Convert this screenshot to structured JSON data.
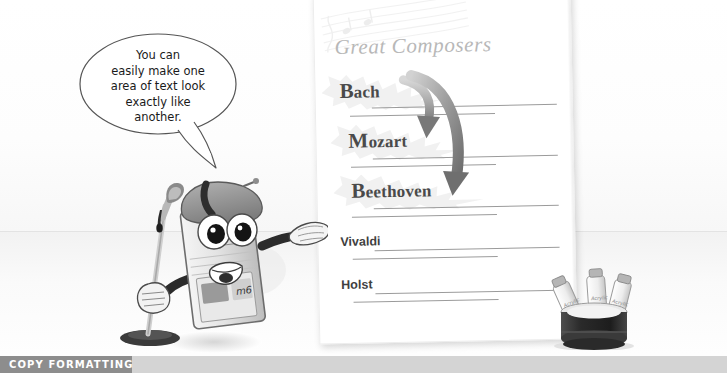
{
  "caption": {
    "label": "COPY FORMATTING"
  },
  "speech_bubble": {
    "lines": [
      "You can",
      "easily make one",
      "area of text look",
      "exactly like",
      "another."
    ],
    "text": "You can easily make one area of text look exactly like another."
  },
  "document": {
    "title": "Great Composers",
    "watermark": "music-staff-watermark",
    "entries": [
      {
        "name": "Bach",
        "style": "formatted",
        "initial": "B",
        "rest": "ach"
      },
      {
        "name": "Mozart",
        "style": "formatted",
        "initial": "M",
        "rest": "ozart"
      },
      {
        "name": "Beethoven",
        "style": "formatted",
        "initial": "B",
        "rest": "eethoven"
      },
      {
        "name": "Vivaldi",
        "style": "plain"
      },
      {
        "name": "Holst",
        "style": "plain"
      }
    ]
  },
  "annotations": {
    "arrow_one": "curved-arrow-bach-to-mozart",
    "arrow_two": "curved-arrow-bach-to-beethoven"
  },
  "illustration": {
    "mascot": "floppy-disk-character-artist",
    "mascot_hat": "beret",
    "mascot_tool": "paintbrush",
    "mascot_gesture": "pointing-hand",
    "props": "paint-tube-container"
  },
  "colors": {
    "caption_block": "#8d8d8d",
    "caption_bar": "#d4d4d4",
    "caption_text": "#ffffff",
    "title_gray": "#b8b8b8",
    "name_dark": "#4a4a4a",
    "rule_gray": "#9b9b9b",
    "arrow_gray": "#8f8f8f",
    "page_white": "#ffffff"
  }
}
